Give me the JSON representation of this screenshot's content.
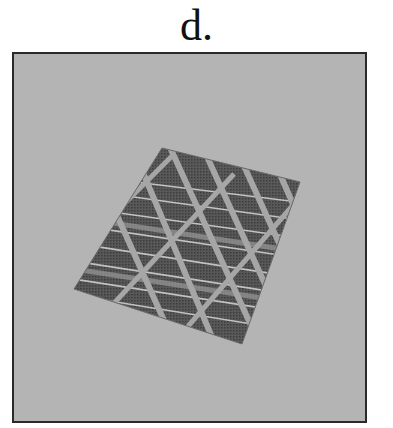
{
  "panel_label": "d.",
  "image": {
    "description": "Grayscale photo of a woven fabric swatch with diagonal light stripes and horizontal bands, lying tilted on a gray background",
    "background_color": "#b4b4b4",
    "frame_color": "#2a2a2a"
  }
}
